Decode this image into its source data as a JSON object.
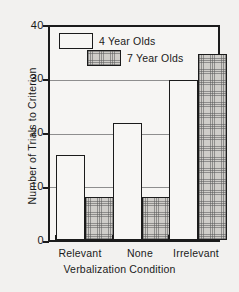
{
  "chart_data": {
    "type": "bar",
    "title": "",
    "xlabel": "Verbalization Condition",
    "ylabel": "Number of Trials to Criterion",
    "categories": [
      "Relevant",
      "None",
      "Irrelevant"
    ],
    "series": [
      {
        "name": "4 Year Olds",
        "values": [
          16,
          22,
          30
        ],
        "fill": "white"
      },
      {
        "name": "7 Year Olds",
        "values": [
          8,
          8,
          35
        ],
        "fill": "cross-hatch"
      }
    ],
    "ylim": [
      0,
      40
    ],
    "yticks": [
      0,
      10,
      20,
      30,
      40
    ],
    "ytick_labels": [
      "0",
      "10",
      "20",
      "30",
      "40"
    ],
    "grid": "horizontal",
    "legend_position": "top-left",
    "colors": {
      "axis": "#1b1b1b",
      "grid": "#8e8e8e",
      "series_1_fill": "#f7f6f4",
      "series_2_fill": "#cfcdc9",
      "background": "#f2f1ef"
    }
  }
}
